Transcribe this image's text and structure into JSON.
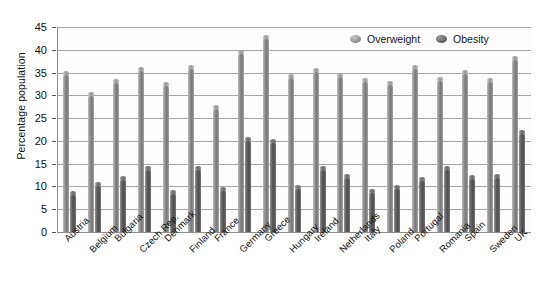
{
  "chart_data": {
    "type": "bar",
    "title": "",
    "xlabel": "",
    "ylabel": "Percentage population",
    "ylim": [
      0,
      45
    ],
    "yticks": [
      0,
      5,
      10,
      15,
      20,
      25,
      30,
      35,
      40,
      45
    ],
    "grid": true,
    "legend_position": "top-right",
    "categories": [
      "Austria",
      "Belgium",
      "Bulgaria",
      "Czech Rep.",
      "Denmark",
      "Finland",
      "France",
      "Germany",
      "Greece",
      "Hungary",
      "Ireland",
      "Netherlands",
      "Italy",
      "Poland",
      "Portugal",
      "Romania",
      "Spain",
      "Sweden",
      "UK"
    ],
    "series": [
      {
        "name": "Overweight",
        "color": "#8c8c8c",
        "values": [
          35.0,
          30.3,
          33.2,
          35.8,
          32.4,
          36.3,
          27.4,
          39.5,
          42.9,
          34.2,
          35.6,
          34.4,
          33.3,
          32.8,
          36.2,
          33.5,
          35.2,
          33.3,
          38.1
        ]
      },
      {
        "name": "Obesity",
        "color": "#5a5a5a",
        "values": [
          8.6,
          10.5,
          11.8,
          14.0,
          8.7,
          14.1,
          9.4,
          20.5,
          20.0,
          9.9,
          14.1,
          12.4,
          9.0,
          9.8,
          11.6,
          14.0,
          12.0,
          12.4,
          22.0
        ]
      }
    ]
  },
  "legend": {
    "items": [
      {
        "label": "Overweight",
        "marker": "overweight-swatch"
      },
      {
        "label": "Obesity",
        "marker": "obesity-swatch"
      }
    ]
  }
}
